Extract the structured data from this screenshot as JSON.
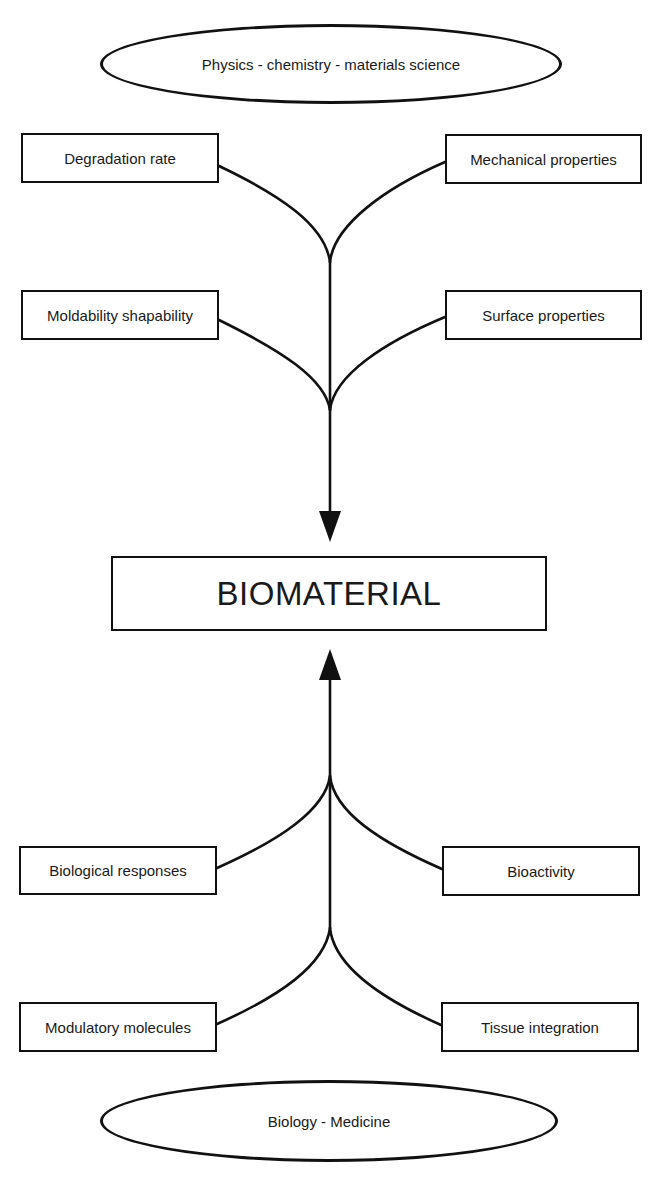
{
  "diagram": {
    "top_domain": "Physics - chemistry - materials science",
    "bottom_domain": "Biology - Medicine",
    "center": "BIOMATERIAL",
    "top_factors": {
      "upper_left": "Degradation rate",
      "upper_right": "Mechanical properties",
      "lower_left": "Moldability shapability",
      "lower_right": "Surface properties"
    },
    "bottom_factors": {
      "upper_left": "Biological responses",
      "upper_right": "Bioactivity",
      "lower_left": "Modulatory molecules",
      "lower_right": "Tissue integration"
    },
    "colors": {
      "stroke": "#111111",
      "background": "#ffffff"
    }
  }
}
